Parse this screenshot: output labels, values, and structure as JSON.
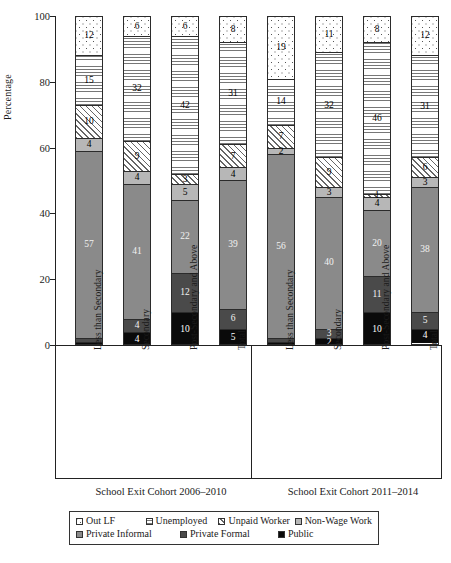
{
  "axis": {
    "ylabel": "Percentage",
    "yticks": [
      "100",
      "80",
      "60",
      "40",
      "20",
      "0"
    ]
  },
  "groups": [
    {
      "label": "School Exit Cohort 2006–2010"
    },
    {
      "label": "School Exit Cohort 2011–2014"
    }
  ],
  "categories": [
    "Less than Secondary",
    "Secondary",
    "Post-Secondary and Above",
    "Total"
  ],
  "legend": {
    "row1": [
      {
        "label": "Out LF",
        "key": "out_lf"
      },
      {
        "label": "Unemployed",
        "key": "unemployed"
      },
      {
        "label": "Unpaid Worker",
        "key": "unpaid_worker"
      },
      {
        "label": "Non-Wage Work",
        "key": "non_wage_work"
      }
    ],
    "row2": [
      {
        "label": "Private Informal",
        "key": "private_informal"
      },
      {
        "label": "Private Formal",
        "key": "private_formal"
      },
      {
        "label": "Public",
        "key": "public"
      }
    ]
  },
  "chart_data": {
    "type": "bar",
    "subtype": "stacked-100",
    "title": "",
    "xlabel": "",
    "ylabel": "Percentage",
    "ylim": [
      0,
      100
    ],
    "yticks": [
      0,
      20,
      40,
      60,
      80,
      100
    ],
    "grid": false,
    "legend_position": "bottom",
    "panels": [
      {
        "name": "School Exit Cohort 2006–2010",
        "categories": [
          "Less than Secondary",
          "Secondary",
          "Post-Secondary and Above",
          "Total"
        ],
        "series": [
          {
            "name": "Out LF",
            "values": [
              12,
              6,
              6,
              8
            ]
          },
          {
            "name": "Unemployed",
            "values": [
              15,
              32,
              42,
              31
            ]
          },
          {
            "name": "Unpaid Worker",
            "values": [
              10,
              9,
              3,
              7
            ]
          },
          {
            "name": "Non-Wage Work",
            "values": [
              4,
              4,
              5,
              4
            ]
          },
          {
            "name": "Private Informal",
            "values": [
              57,
              41,
              22,
              39
            ]
          },
          {
            "name": "Private Formal",
            "values": [
              1,
              4,
              12,
              6
            ]
          },
          {
            "name": "Public",
            "values": [
              1,
              4,
              10,
              5
            ]
          }
        ]
      },
      {
        "name": "School Exit Cohort 2011–2014",
        "categories": [
          "Less than Secondary",
          "Secondary",
          "Post-Secondary and Above",
          "Total"
        ],
        "series": [
          {
            "name": "Out LF",
            "values": [
              19,
              11,
              8,
              12
            ]
          },
          {
            "name": "Unemployed",
            "values": [
              14,
              32,
              46,
              31
            ]
          },
          {
            "name": "Unpaid Worker",
            "values": [
              7,
              9,
              1,
              6
            ]
          },
          {
            "name": "Non-Wage Work",
            "values": [
              2,
              3,
              4,
              3
            ]
          },
          {
            "name": "Private Informal",
            "values": [
              56,
              40,
              20,
              38
            ]
          },
          {
            "name": "Private Formal",
            "values": [
              1,
              3,
              11,
              5
            ]
          },
          {
            "name": "Public",
            "values": [
              1,
              2,
              10,
              4
            ]
          }
        ]
      }
    ],
    "labeled_values": {
      "panel0": {
        "Less than Secondary": {
          "Out LF": "12",
          "Unemployed": "15",
          "Unpaid Worker": "10",
          "Non-Wage Work": "4",
          "Private Informal": "57",
          "Private Formal": "",
          "Public": ""
        },
        "Secondary": {
          "Out LF": "6",
          "Unemployed": "32",
          "Unpaid Worker": "9",
          "Non-Wage Work": "4",
          "Private Informal": "41",
          "Private Formal": "4",
          "Public": "4"
        },
        "Post-Secondary and Above": {
          "Out LF": "6",
          "Unemployed": "42",
          "Unpaid Worker": "3",
          "Non-Wage Work": "5",
          "Private Informal": "22",
          "Private Formal": "12",
          "Public": "10"
        },
        "Total": {
          "Out LF": "8",
          "Unemployed": "31",
          "Unpaid Worker": "7",
          "Non-Wage Work": "4",
          "Private Informal": "39",
          "Private Formal": "6",
          "Public": "5"
        }
      },
      "panel1": {
        "Less than Secondary": {
          "Out LF": "19",
          "Unemployed": "14",
          "Unpaid Worker": "7",
          "Non-Wage Work": "2",
          "Private Informal": "56",
          "Private Formal": "",
          "Public": ""
        },
        "Secondary": {
          "Out LF": "11",
          "Unemployed": "32",
          "Unpaid Worker": "9",
          "Non-Wage Work": "3",
          "Private Informal": "40",
          "Private Formal": "3",
          "Public": "2"
        },
        "Post-Secondary and Above": {
          "Out LF": "8",
          "Unemployed": "46",
          "Unpaid Worker": "1",
          "Non-Wage Work": "4",
          "Private Informal": "20",
          "Private Formal": "11",
          "Public": "10"
        },
        "Total": {
          "Out LF": "12",
          "Unemployed": "31",
          "Unpaid Worker": "6",
          "Non-Wage Work": "3",
          "Private Informal": "38",
          "Private Formal": "5",
          "Public": "4"
        }
      }
    },
    "colors": {
      "out_lf": "#ffffff",
      "unemployed": "#ffffff",
      "unpaid_worker": "#ffffff",
      "non_wage_work": "#b7b7b7",
      "private_informal": "#8a8a8a",
      "private_formal": "#4a4a4a",
      "public": "#0a0a0a"
    }
  }
}
